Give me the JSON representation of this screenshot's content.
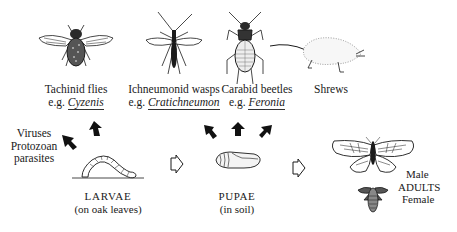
{
  "predators": [
    {
      "id": "tachinid",
      "name": "Tachinid flies",
      "eg_prefix": "e.g.",
      "example": "Cyzenis"
    },
    {
      "id": "ichneumonid",
      "name": "Ichneumonid wasps",
      "eg_prefix": "e.g.",
      "example": "Cratichneumon"
    },
    {
      "id": "carabid",
      "name": "Carabid beetles",
      "eg_prefix": "e.g.",
      "example": "Feronia"
    },
    {
      "id": "shrews",
      "name": "Shrews"
    }
  ],
  "pathogens": {
    "lines": [
      "Viruses",
      "Protozoan",
      "parasites"
    ]
  },
  "stages": {
    "larvae": {
      "name": "LARVAE",
      "habitat": "(on oak leaves)"
    },
    "pupae": {
      "name": "PUPAE",
      "habitat": "(in soil)"
    },
    "adults": {
      "male": "Male",
      "name": "ADULTS",
      "female": "Female"
    }
  },
  "colors": {
    "ink": "#1a1a1a",
    "background": "#ffffff"
  }
}
